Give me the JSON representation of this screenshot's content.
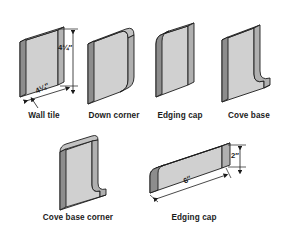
{
  "figure": {
    "background_color": "#ffffff",
    "face_color": "#d0d0d0",
    "side_color": "#9a9a9a",
    "edge_color": "#7d7d7d",
    "top_color": "#bdbdbd",
    "outline_color": "#1b1b1b",
    "projection": "isometric"
  },
  "shapes": [
    {
      "id": "wall-tile",
      "label": "Wall tile",
      "description": "flat square slab",
      "dimensions": [
        {
          "id": "height",
          "value": "4¼″",
          "orientation": "vertical"
        },
        {
          "id": "width",
          "value": "4¼″",
          "orientation": "diagonal"
        }
      ]
    },
    {
      "id": "down-corner",
      "label": "Down corner",
      "description": "square tile with two rounded corners on one side",
      "dimensions": []
    },
    {
      "id": "edging-cap-top",
      "label": "Edging cap",
      "description": "square tile with bullnose rounded top edge",
      "dimensions": []
    },
    {
      "id": "cove-base",
      "label": "Cove base",
      "description": "square tile with concave coved foot at bottom",
      "dimensions": []
    },
    {
      "id": "cove-base-corner",
      "label": "Cove base corner",
      "description": "narrow coved base corner piece",
      "dimensions": []
    },
    {
      "id": "edging-cap-bar",
      "label": "Edging cap",
      "description": "long narrow bullnose bar",
      "dimensions": [
        {
          "id": "height",
          "value": "2″",
          "orientation": "vertical"
        },
        {
          "id": "length",
          "value": "6″",
          "orientation": "diagonal"
        }
      ]
    }
  ],
  "captions": {
    "wall_tile": "Wall tile",
    "down_corner": "Down corner",
    "edging_cap_top": "Edging cap",
    "cove_base": "Cove base",
    "cove_base_corner": "Cove base corner",
    "edging_cap_bar": "Edging cap"
  },
  "dimension_labels": {
    "wall_tile_height": "4¼″",
    "wall_tile_width": "4¼″",
    "edging_cap_bar_height": "2″",
    "edging_cap_bar_length": "6″"
  }
}
